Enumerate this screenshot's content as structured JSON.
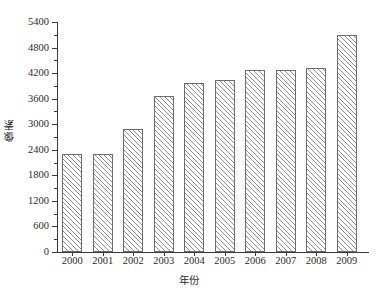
{
  "chart_data": {
    "type": "bar",
    "title": "",
    "subtitle": "",
    "xlabel": "年份",
    "ylabel": "像素",
    "categories": [
      "2000",
      "2001",
      "2002",
      "2003",
      "2004",
      "2005",
      "2006",
      "2007",
      "2008",
      "2009"
    ],
    "values": [
      2290,
      2290,
      2890,
      3670,
      3970,
      4050,
      4270,
      4270,
      4320,
      5100
    ],
    "series": [
      {
        "name": "像素",
        "values": [
          2290,
          2290,
          2890,
          3670,
          3970,
          4050,
          4270,
          4270,
          4320,
          5100
        ]
      }
    ],
    "ylim": [
      0,
      5400
    ],
    "xlim_categories": 10,
    "ytick_labels": [
      "0",
      "600",
      "1200",
      "1800",
      "2400",
      "3000",
      "3600",
      "4200",
      "4800",
      "5400"
    ],
    "ytick_values": [
      0,
      600,
      1200,
      1800,
      2400,
      3000,
      3600,
      4200,
      4800,
      5400
    ],
    "ytick_minor_values": [
      300,
      900,
      1500,
      2100,
      2700,
      3300,
      3900,
      4500,
      5100
    ],
    "grid": false,
    "legend": null,
    "legend_position": "none",
    "bar_fill": "#ffffff",
    "bar_edge_color": "#6c6c6c",
    "bar_hatch": "diagonal-45",
    "axis_color": "#3a3a3a",
    "text_color": "#2b2b2b",
    "background": "#ffffff"
  }
}
